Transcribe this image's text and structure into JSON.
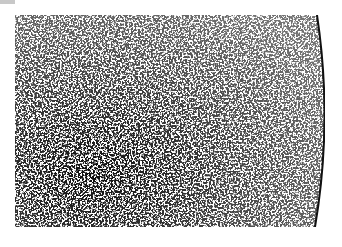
{
  "image": {
    "description": "micrograph texture with dark speckles and curved boundary on right edge",
    "colors": {
      "background": "#ffffff",
      "speckle": "#1a1a1a",
      "edge": "#111111",
      "corner_mark": "#c8c8c8"
    }
  }
}
